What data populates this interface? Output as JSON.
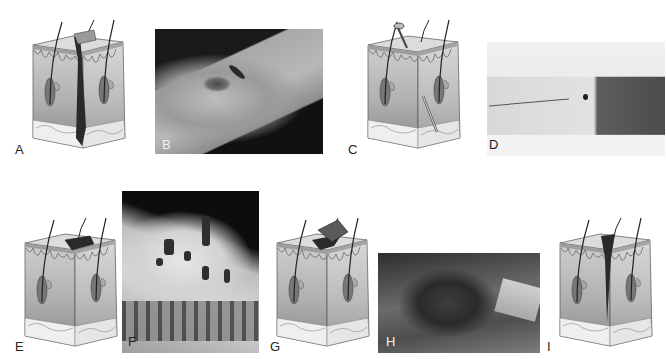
{
  "figure": {
    "type": "wound-types-figure",
    "colors": {
      "background": "#ffffff",
      "epidermis": "#d6d6d6",
      "dermis_top": "#c4c4c4",
      "dermis_bottom": "#8e8e8e",
      "subcutaneous": "#ececec",
      "wound": "#2a2a2a"
    },
    "panels": [
      {
        "label": "A",
        "kind": "illustration",
        "depicts": "incision-cross-section"
      },
      {
        "label": "B",
        "kind": "photo",
        "depicts": "incision-photo"
      },
      {
        "label": "C",
        "kind": "illustration",
        "depicts": "puncture-cross-section"
      },
      {
        "label": "D",
        "kind": "photo",
        "depicts": "puncture-photo"
      },
      {
        "label": "E",
        "kind": "illustration",
        "depicts": "abrasion-cross-section"
      },
      {
        "label": "F",
        "kind": "photo",
        "depicts": "abrasion-photo"
      },
      {
        "label": "G",
        "kind": "illustration",
        "depicts": "avulsion-cross-section"
      },
      {
        "label": "H",
        "kind": "photo",
        "depicts": "avulsion-photo"
      },
      {
        "label": "I",
        "kind": "illustration",
        "depicts": "laceration-cross-section"
      }
    ]
  }
}
